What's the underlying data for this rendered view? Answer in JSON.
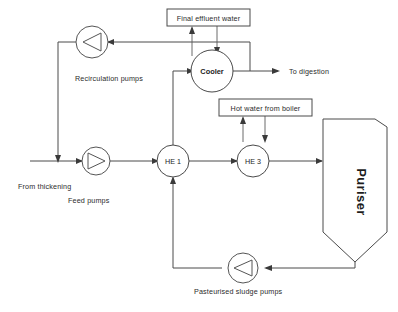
{
  "diagram": {
    "type": "process-flow-diagram",
    "canvas": {
      "width": 398,
      "height": 312
    },
    "colors": {
      "background": "#ffffff",
      "line": "#4a4a4a",
      "text": "#2b2b2b",
      "arrow": "#3a3a3a"
    },
    "nodes": {
      "final_effluent_water": "Final effluent water",
      "cooler": "Cooler",
      "hot_water_from_boiler": "Hot water from boiler",
      "he1": "HE 1",
      "he3": "HE 3",
      "puriser": "Puriser"
    },
    "labels": {
      "recirculation_pumps": "Recirculation pumps",
      "to_digestion": "To digestion",
      "from_thickening": "From thickening",
      "feed_pumps": "Feed pumps",
      "pasteurised_sludge_pumps": "Pasteurised sludge pumps"
    },
    "icons": {
      "pump_recirculation": "pump-icon",
      "pump_feed": "pump-icon",
      "pump_sludge": "pump-icon"
    }
  }
}
